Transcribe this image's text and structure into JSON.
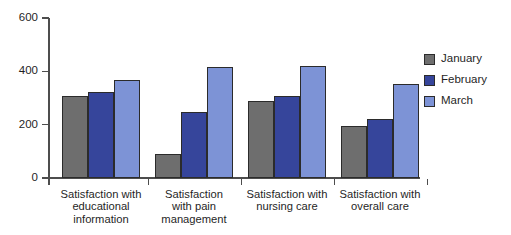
{
  "chart_data": {
    "type": "bar",
    "title": "",
    "subtitle": "",
    "xlabel": "",
    "ylabel": "",
    "ylim": [
      0,
      600
    ],
    "yticks": [
      0,
      200,
      400,
      600
    ],
    "grid": false,
    "legend_position": "right",
    "categories": [
      "Satisfaction with educational information",
      "Satisfaction with pain management",
      "Satisfaction with nursing care",
      "Satisfaction with overall care"
    ],
    "category_lines": [
      [
        "Satisfaction with",
        "educational",
        "information"
      ],
      [
        "Satisfaction",
        "with pain",
        "management"
      ],
      [
        "Satisfaction with",
        "nursing care"
      ],
      [
        "Satisfaction with",
        "overall care"
      ]
    ],
    "series": [
      {
        "name": "January",
        "color": "#6e6e6e",
        "values": [
          308,
          90,
          289,
          195
        ]
      },
      {
        "name": "February",
        "color": "#36459b",
        "values": [
          323,
          248,
          308,
          222
        ]
      },
      {
        "name": "March",
        "color": "#7d93d6",
        "values": [
          368,
          416,
          420,
          353
        ]
      }
    ]
  },
  "axis": {
    "y_tick_labels": [
      "600",
      "400",
      "200",
      "0"
    ]
  },
  "legend": {
    "items": [
      {
        "label": "January",
        "swatch": "#6e6e6e"
      },
      {
        "label": "February",
        "swatch": "#36459b"
      },
      {
        "label": "March",
        "swatch": "#7d93d6"
      }
    ]
  }
}
